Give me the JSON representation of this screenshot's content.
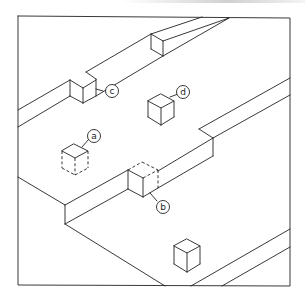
{
  "diagram": {
    "type": "isometric-step-blocks",
    "frame": {
      "x1": 18,
      "y1": 16,
      "x2": 290,
      "y2": 286
    },
    "colors": {
      "line": "#222222",
      "background": "#ffffff"
    },
    "labels": [
      {
        "id": "a",
        "text": "a",
        "cx": 94,
        "cy": 136,
        "cube": "cube-a",
        "style": "dashed-lower"
      },
      {
        "id": "b",
        "text": "b",
        "cx": 163,
        "cy": 207,
        "cube": "cube-b",
        "style": "dashed-upper"
      },
      {
        "id": "c",
        "text": "c",
        "cx": 112,
        "cy": 91,
        "cube": "cube-c",
        "style": "embedded-in-step"
      },
      {
        "id": "d",
        "text": "d",
        "cx": 183,
        "cy": 92,
        "cube": "cube-d",
        "style": "solid"
      }
    ],
    "unlabeled_cubes": 1
  }
}
